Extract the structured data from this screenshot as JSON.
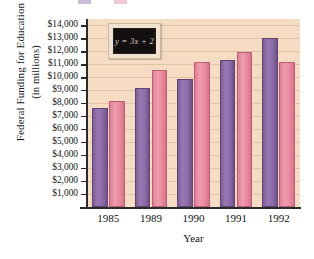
{
  "chart_data": {
    "type": "bar",
    "title": "",
    "xlabel": "Year",
    "ylabel_line1": "Federal Funding for Education",
    "ylabel_line2": "(in millions)",
    "categories": [
      "1985",
      "1989",
      "1990",
      "1991",
      "1992"
    ],
    "series": [
      {
        "name": "series-1",
        "color": "#8b6ba8",
        "values": [
          7600,
          9200,
          9900,
          11350,
          13050
        ]
      },
      {
        "name": "series-2",
        "color": "#e8899e",
        "values": [
          8200,
          10600,
          11150,
          11950,
          11150
        ]
      }
    ],
    "ylim": [
      0,
      14500
    ],
    "ytick_values": [
      1000,
      2000,
      3000,
      4000,
      5000,
      6000,
      7000,
      8000,
      9000,
      10000,
      11000,
      12000,
      13000,
      14000
    ],
    "ytick_labels": [
      "$1,000",
      "$2,000",
      "$3,000",
      "$4,000",
      "$5,000",
      "$6,000",
      "$7,000",
      "$8,000",
      "$9,000",
      "$10,000",
      "$11,000",
      "$12,000",
      "$13,000",
      "$14,000"
    ],
    "grid": true,
    "legend_position": "top-cropped",
    "plot_background": "#f6dcc2",
    "annotations": [
      {
        "name": "chalkboard-equation",
        "text": "y = 3x + 2"
      }
    ]
  }
}
